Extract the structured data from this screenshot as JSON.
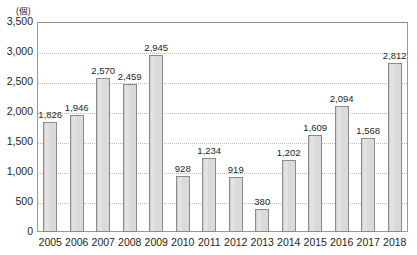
{
  "chart_data": {
    "type": "bar",
    "title": "",
    "xlabel": "",
    "ylabel": "(個)",
    "unit_label": "(個)",
    "categories": [
      "2005",
      "2006",
      "2007",
      "2008",
      "2009",
      "2010",
      "2011",
      "2012",
      "2013",
      "2014",
      "2015",
      "2016",
      "2017",
      "2018"
    ],
    "values": [
      1826,
      1946,
      2570,
      2459,
      2945,
      928,
      1234,
      919,
      380,
      1202,
      1609,
      2094,
      1568,
      2812
    ],
    "value_labels": [
      "1,826",
      "1,946",
      "2,570",
      "2,459",
      "2,945",
      "928",
      "1,234",
      "919",
      "380",
      "1,202",
      "1,609",
      "2,094",
      "1,568",
      "2,812"
    ],
    "ylim": [
      0,
      3500
    ],
    "ytick_values": [
      0,
      500,
      1000,
      1500,
      2000,
      2500,
      3000,
      3500
    ],
    "ytick_labels": [
      "0",
      "500",
      "1,000",
      "1,500",
      "2,000",
      "2,500",
      "3,000",
      "3,500"
    ],
    "grid": true,
    "grid_axis": "y",
    "legend": false,
    "legend_position": "none",
    "bar_color": "#d9d9d9",
    "bar_border_color": "#8a8a8a",
    "grid_color": "#b9b9b9",
    "axis_color": "#9a9a9a",
    "text_color": "#231f20",
    "data_labels_shown": true
  }
}
